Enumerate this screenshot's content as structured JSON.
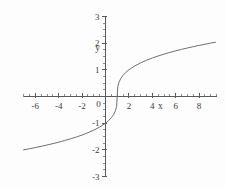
{
  "chart_data": {
    "type": "line",
    "title": "",
    "subtitle": "",
    "xlabel": "x",
    "ylabel": "y",
    "xlim": [
      -7.0,
      9.5
    ],
    "ylim": [
      -3.0,
      3.0
    ],
    "grid": false,
    "legend": null,
    "legend_position": "none",
    "x_ticks": [
      -6,
      -4,
      -2,
      0,
      2,
      4,
      6,
      8
    ],
    "x_tick_labels": [
      "-6",
      "-4",
      "-2",
      "0",
      "2",
      "4",
      "6",
      "8"
    ],
    "y_ticks": [
      -3,
      -2,
      -1,
      1,
      2,
      3
    ],
    "y_tick_labels": [
      "-3",
      "-2",
      "-1",
      "1",
      "2",
      "3"
    ],
    "x_minor_tick_step": 0.5,
    "y_minor_tick_step": 0.25,
    "axis_color": "#5a5a5a",
    "curve_color": "#6f6f6f",
    "background_color": "#fdfdfd",
    "origin_label": "0",
    "series": [
      {
        "name": "cube-root-curve",
        "equation": "y = (x - 1)^(1/3)",
        "x": [
          -7.0,
          -6.5,
          -6.0,
          -5.5,
          -5.0,
          -4.5,
          -4.0,
          -3.5,
          -3.0,
          -2.5,
          -2.0,
          -1.5,
          -1.0,
          -0.5,
          0.0,
          0.25,
          0.5,
          0.7,
          0.85,
          0.95,
          1.0,
          1.05,
          1.15,
          1.3,
          1.5,
          1.75,
          2.0,
          2.5,
          3.0,
          3.5,
          4.0,
          4.5,
          5.0,
          5.5,
          6.0,
          6.5,
          7.0,
          7.5,
          8.0,
          8.5,
          9.0,
          9.4
        ],
        "y": [
          -2.0,
          -1.956,
          -1.913,
          -1.866,
          -1.817,
          -1.765,
          -1.71,
          -1.651,
          -1.587,
          -1.518,
          -1.442,
          -1.357,
          -1.26,
          -1.145,
          -1.0,
          -0.909,
          -0.794,
          -0.669,
          -0.531,
          -0.368,
          0.0,
          0.368,
          0.531,
          0.669,
          0.794,
          0.909,
          1.0,
          1.145,
          1.26,
          1.357,
          1.442,
          1.518,
          1.587,
          1.651,
          1.71,
          1.765,
          1.817,
          1.866,
          1.913,
          1.957,
          2.0,
          2.031
        ]
      }
    ],
    "notes": {
      "x_intercept": 1.0,
      "y_intercept": -1.0,
      "inflection_point": [
        1.0,
        0.0
      ]
    }
  },
  "figure": {
    "name": "cube-root-function-plot"
  }
}
